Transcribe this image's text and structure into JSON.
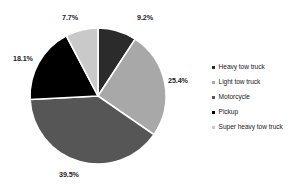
{
  "chart_data": {
    "type": "pie",
    "title": "",
    "categories": [
      "Heavy tow  truck",
      "Light tow truck",
      "Motorcycle",
      "Pickup",
      "Super heavy tow  truck"
    ],
    "values": [
      9.2,
      25.4,
      39.5,
      18.1,
      7.7
    ],
    "value_labels": [
      "9.2%",
      "25.4%",
      "39.5%",
      "18.1%",
      "7.7%"
    ],
    "unit": "%",
    "colors": [
      "#2b2b2b",
      "#a8a8a8",
      "#565656",
      "#000000",
      "#c9c9c9"
    ],
    "slice_border_color": "#ffffff",
    "start_angle_deg": 0,
    "direction": "clockwise",
    "legend_position": "right",
    "grid": false,
    "xlabel": "",
    "ylabel": ""
  },
  "legend": {
    "items": [
      {
        "label": "Heavy tow  truck",
        "color": "#2b2b2b"
      },
      {
        "label": "Light tow truck",
        "color": "#a8a8a8"
      },
      {
        "label": "Motorcycle",
        "color": "#565656"
      },
      {
        "label": "Pickup",
        "color": "#000000"
      },
      {
        "label": "Super heavy tow  truck",
        "color": "#c9c9c9"
      }
    ]
  }
}
